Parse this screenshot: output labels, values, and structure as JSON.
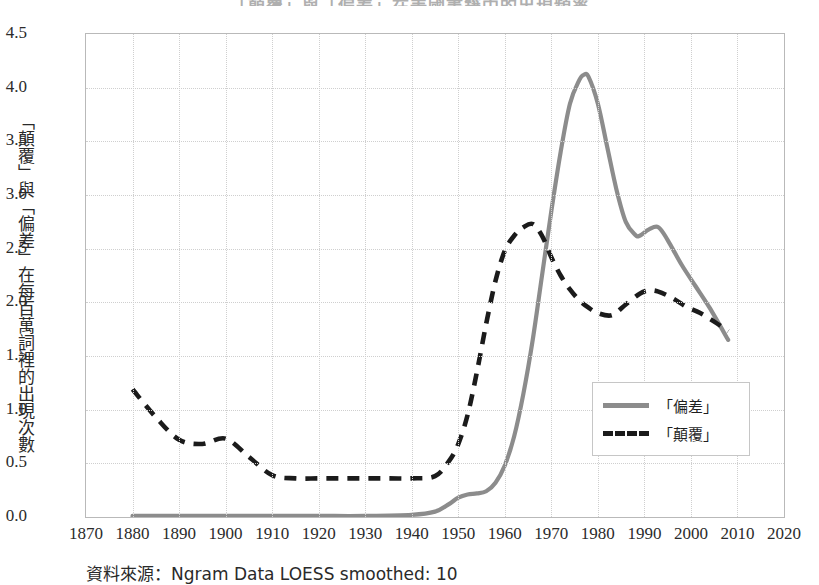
{
  "chart_data": {
    "type": "line",
    "title": "「顛覆」與「偏差」在美國書籍中的出現頻率",
    "xlabel": "",
    "ylabel": "「顛覆」與「偏差」在每百萬詞裡的出現次數",
    "xlim": [
      1870,
      2020
    ],
    "ylim": [
      0.0,
      4.5
    ],
    "xticks": [
      1870,
      1880,
      1890,
      1900,
      1910,
      1920,
      1930,
      1940,
      1950,
      1960,
      1970,
      1980,
      1990,
      2000,
      2010,
      2020
    ],
    "yticks": [
      "0.0",
      "0.5",
      "1.0",
      "1.5",
      "2.0",
      "2.5",
      "3.0",
      "3.5",
      "4.0",
      "4.5"
    ],
    "grid": true,
    "legend_position": "center-right",
    "source_note": "資料來源：Ngram Data LOESS smoothed: 10",
    "series": [
      {
        "name": "「偏差」",
        "style": "solid",
        "color": "#8c8c8c",
        "x": [
          1880,
          1890,
          1900,
          1910,
          1920,
          1930,
          1940,
          1945,
          1948,
          1950,
          1952,
          1954,
          1956,
          1958,
          1960,
          1962,
          1964,
          1966,
          1968,
          1970,
          1972,
          1974,
          1976,
          1977,
          1978,
          1980,
          1982,
          1984,
          1986,
          1988,
          1989,
          1991,
          1993,
          1995,
          1998,
          2001,
          2004,
          2008
        ],
        "values": [
          0.01,
          0.01,
          0.01,
          0.01,
          0.01,
          0.01,
          0.02,
          0.05,
          0.12,
          0.18,
          0.21,
          0.22,
          0.24,
          0.32,
          0.48,
          0.75,
          1.15,
          1.65,
          2.25,
          2.85,
          3.4,
          3.85,
          4.07,
          4.12,
          4.1,
          3.85,
          3.45,
          3.05,
          2.75,
          2.63,
          2.62,
          2.68,
          2.7,
          2.58,
          2.35,
          2.15,
          1.95,
          1.65
        ]
      },
      {
        "name": "「顛覆」",
        "style": "dashed",
        "color": "#1b1b1b",
        "x": [
          1880,
          1885,
          1890,
          1895,
          1900,
          1905,
          1910,
          1915,
          1920,
          1925,
          1930,
          1935,
          1940,
          1945,
          1948,
          1950,
          1952,
          1954,
          1956,
          1958,
          1960,
          1962,
          1964,
          1966,
          1968,
          1970,
          1972,
          1974,
          1976,
          1978,
          1980,
          1983,
          1986,
          1989,
          1991,
          1993,
          1996,
          1999,
          2002,
          2005,
          2008
        ],
        "values": [
          1.19,
          0.93,
          0.72,
          0.68,
          0.73,
          0.56,
          0.39,
          0.36,
          0.36,
          0.36,
          0.36,
          0.36,
          0.36,
          0.38,
          0.52,
          0.68,
          0.95,
          1.35,
          1.8,
          2.2,
          2.48,
          2.62,
          2.7,
          2.73,
          2.62,
          2.42,
          2.25,
          2.12,
          2.02,
          1.95,
          1.9,
          1.88,
          1.98,
          2.08,
          2.11,
          2.1,
          2.04,
          1.96,
          1.9,
          1.82,
          1.73
        ]
      }
    ]
  },
  "legend": {
    "items": [
      {
        "label": "「偏差」",
        "style": "solid"
      },
      {
        "label": "「顛覆」",
        "style": "dashed"
      }
    ]
  }
}
